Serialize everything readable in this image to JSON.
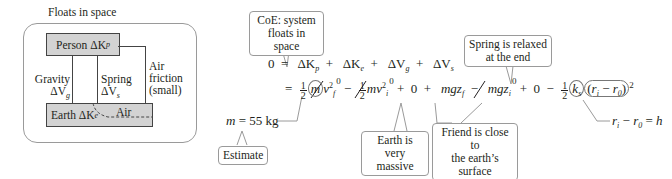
{
  "diagram": {
    "system_title": "Floats in space",
    "person_box": {
      "label": "Person",
      "symbol": "ΔK",
      "sub": "p"
    },
    "earth_box": {
      "label": "Earth",
      "symbol": "ΔK",
      "sub": "e"
    },
    "air_label": "Air",
    "gravity": {
      "label": "Gravity",
      "symbol": "ΔV",
      "sub": "g"
    },
    "spring": {
      "label": "Spring",
      "symbol": "ΔV",
      "sub": "s"
    },
    "friction": {
      "line1": "Air",
      "line2": "friction",
      "line3": "(small)"
    }
  },
  "callouts": {
    "coe": {
      "line1": "CoE: system",
      "line2": "floats in space"
    },
    "spring_relaxed": {
      "line1": "Spring is relaxed",
      "line2": "at the end"
    },
    "earth_massive": {
      "line1": "Earth is",
      "line2": "very massive"
    },
    "friend_close": {
      "line1": "Friend is close to",
      "line2": "the earth’s surface"
    },
    "estimate": "Estimate"
  },
  "equations": {
    "line1": {
      "lhs": "0",
      "eq": "=",
      "terms": [
        {
          "sym": "ΔK",
          "sub": "p"
        },
        {
          "sym": "ΔK",
          "sub": "e"
        },
        {
          "sym": "ΔV",
          "sub": "g"
        },
        {
          "sym": "ΔV",
          "sub": "s"
        }
      ],
      "plus": "+"
    },
    "line2": {
      "eq": "=",
      "half_num": "1",
      "half_den": "2",
      "m": "m",
      "vf": "v",
      "vf_sup": "2",
      "vf_sub": "f",
      "zero": "0",
      "minus": "−",
      "plus": "+",
      "mv": "mv",
      "vi_sup": "2",
      "vi_sub": "i",
      "mgz": "mgz",
      "zf_sub": "f",
      "zi_sub": "i",
      "ks": "k",
      "ks_sub": "s",
      "paren_open": "(",
      "r": "r",
      "ri_sub": "i",
      "r0_sub": "0",
      "paren_close": ")",
      "sq": "2"
    },
    "mass": {
      "text": "m",
      "eq": "= 55 kg"
    },
    "relation": {
      "lhs": "r",
      "lhs_sub": "i",
      "minus": "−",
      "r0": "r",
      "r0_sub": "0",
      "eq": "=",
      "h": "h"
    }
  }
}
